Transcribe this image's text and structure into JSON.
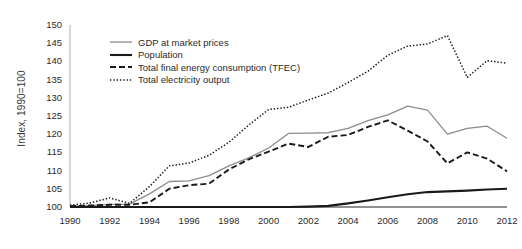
{
  "chart_data": {
    "type": "line",
    "title": "",
    "xlabel": "",
    "ylabel": "Index, 1990=100",
    "xlim": [
      1990,
      2012
    ],
    "ylim": [
      100,
      150
    ],
    "ytick_step": 5,
    "xtick_step": 2,
    "grid": false,
    "legend_position": "upper-left-inside",
    "x": [
      1990,
      1991,
      1992,
      1993,
      1994,
      1995,
      1996,
      1997,
      1998,
      1999,
      2000,
      2001,
      2002,
      2003,
      2004,
      2005,
      2006,
      2007,
      2008,
      2009,
      2010,
      2011,
      2012
    ],
    "yticks": [
      100,
      105,
      110,
      115,
      120,
      125,
      130,
      135,
      140,
      145,
      150
    ],
    "xticks": [
      1990,
      1992,
      1994,
      1996,
      1998,
      2000,
      2002,
      2004,
      2006,
      2008,
      2010,
      2012
    ],
    "series": [
      {
        "name": "GDP at market prices",
        "style": "solid-thin",
        "color": "#8c8c8c",
        "values": [
          100.2,
          100.4,
          100.7,
          100.8,
          103.6,
          107.0,
          107.2,
          108.6,
          111.3,
          113.5,
          116.2,
          120.2,
          120.3,
          120.4,
          121.6,
          123.7,
          125.3,
          127.7,
          126.6,
          120.0,
          121.6,
          122.2,
          118.9
        ]
      },
      {
        "name": "Population",
        "style": "solid-thick",
        "color": "#1a1a1a",
        "values": [
          100.0,
          100.0,
          100.0,
          100.0,
          100.0,
          100.0,
          100.0,
          100.0,
          100.0,
          100.0,
          100.0,
          100.0,
          100.1,
          100.3,
          101.0,
          101.8,
          102.7,
          103.5,
          104.1,
          104.3,
          104.5,
          104.8,
          105.0
        ]
      },
      {
        "name": "Total final energy consumption (TFEC)",
        "style": "dash-dot",
        "color": "#1a1a1a",
        "values": [
          100.2,
          100.4,
          100.6,
          100.6,
          101.3,
          105.0,
          106.0,
          106.4,
          110.3,
          113.1,
          115.2,
          117.4,
          116.5,
          119.3,
          119.8,
          122.0,
          123.8,
          121.0,
          118.0,
          112.0,
          115.0,
          113.3,
          109.8
        ]
      },
      {
        "name": "Total electricity output",
        "style": "dotted",
        "color": "#1a1a1a",
        "values": [
          100.5,
          101.1,
          102.5,
          101.0,
          105.6,
          111.3,
          112.1,
          114.2,
          117.8,
          122.5,
          126.8,
          127.4,
          129.4,
          131.3,
          134.2,
          137.3,
          141.7,
          144.2,
          144.8,
          147.1,
          135.6,
          140.2,
          139.5
        ]
      }
    ]
  },
  "legend": {
    "items": [
      {
        "label": "GDP at market prices",
        "key": "line-key-solid-thin"
      },
      {
        "label": "Population",
        "key": "line-key-solid-thick"
      },
      {
        "label": "Total final energy consumption (TFEC)",
        "key": "line-key-dash-dot"
      },
      {
        "label": "Total electricity output",
        "key": "line-key-dotted"
      }
    ]
  },
  "axes": {
    "y_title": "Index, 1990=100",
    "y_labels": [
      "150",
      "145",
      "140",
      "135",
      "130",
      "125",
      "120",
      "115",
      "110",
      "105",
      "100"
    ],
    "x_labels": [
      "1990",
      "1992",
      "1994",
      "1996",
      "1998",
      "2000",
      "2002",
      "2004",
      "2006",
      "2008",
      "2010",
      "2012"
    ]
  },
  "colors": {
    "gdp": "#8c8c8c",
    "population": "#1a1a1a",
    "tfec": "#1a1a1a",
    "electricity": "#1a1a1a",
    "axis": "#9a9a9a",
    "baseline": "#4a4a4a",
    "text": "#2b2b2b"
  }
}
